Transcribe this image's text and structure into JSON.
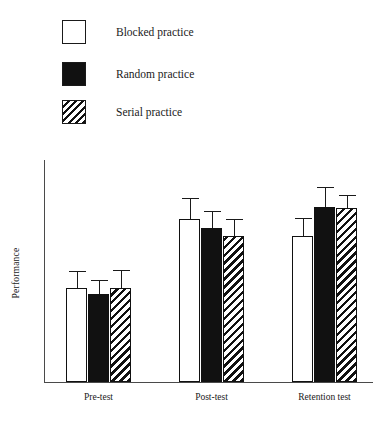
{
  "chart_data": {
    "type": "bar",
    "title": "",
    "subtitle": "",
    "xlabel": "",
    "ylabel": "Performance",
    "categories": [
      "Pre-test",
      "Post-test",
      "Retention test"
    ],
    "series": [
      {
        "name": "Blocked practice",
        "fill": "white",
        "values": [
          94,
          164,
          147
        ],
        "errors": [
          17,
          21,
          18
        ]
      },
      {
        "name": "Random practice",
        "fill": "black",
        "values": [
          88,
          155,
          176
        ],
        "errors": [
          14,
          17,
          20
        ]
      },
      {
        "name": "Serial practice",
        "fill": "hatched",
        "values": [
          94,
          147,
          175
        ],
        "errors": [
          18,
          17,
          13
        ]
      }
    ],
    "ylim": [
      0,
      223
    ],
    "y_ticks": [],
    "grid": false,
    "legend_position": "top-left",
    "axis_color": "#4a4a4a",
    "ink_color": "#111111",
    "background": "#ffffff"
  },
  "legend": {
    "items": [
      {
        "label": "Blocked practice",
        "swatch": "white-square-outline"
      },
      {
        "label": "Random practice",
        "swatch": "black-filled-square"
      },
      {
        "label": "Serial practice",
        "swatch": "diagonal-hatched-square"
      }
    ]
  },
  "axes": {
    "y_title": "Performance",
    "x_tick_labels": [
      "Pre-test",
      "Post-test",
      "Retention test"
    ]
  }
}
